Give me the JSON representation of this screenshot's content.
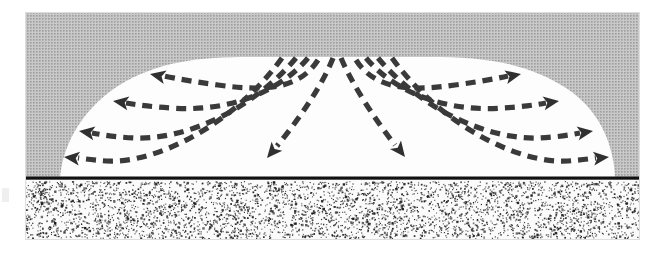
{
  "figure": {
    "type": "cross-section-diagram"
  },
  "colors": {
    "background": "#ffffff",
    "overburden_gray": "#b4b4b4",
    "saturated_zone_white": "#fdfdfd",
    "flow_line": "#3a3a3a",
    "arrowhead": "#303030",
    "water_table_line": "#111111",
    "sand_fill": "#fbfbfb",
    "sand_speckle": "#1c1c1c",
    "frame_edge": "#d8d8d8"
  },
  "layout": {
    "frame": {
      "x": 25,
      "y": 12,
      "width": 615,
      "height": 228
    },
    "gray_block": {
      "x": 25,
      "y": 12,
      "width": 615,
      "height": 166
    },
    "water_table_line": {
      "x1": 25,
      "y1": 178,
      "x2": 640,
      "y2": 178,
      "thickness": 3
    },
    "sand_layer": {
      "x": 25,
      "y": 180,
      "width": 615,
      "height": 60
    },
    "dome": {
      "base_left": 60,
      "base_right": 615,
      "base_y": 178,
      "crest_y": 57,
      "crest_left": 205,
      "crest_right": 470,
      "apex_x": 337
    }
  },
  "labels": {
    "gray_region": "Unsaturated overburden",
    "white_region": "Saturated groundwater mound",
    "sand_region": "Sand aquifer",
    "water_table": "Water table",
    "center_apex": "Recharge apex"
  },
  "chart_data": {
    "type": "line",
    "xlabel": "",
    "ylabel": "",
    "grid": false,
    "legend": "none",
    "annotations": [
      "Flow diverges symmetrically from the central recharge apex",
      "Outer flow lines turn horizontal and exit at the lateral margins",
      "Inner flow lines plunge steeply downward toward the water table"
    ],
    "series": [
      {
        "name": "flow-line-left-1",
        "direction": "left",
        "arrow_at": "start",
        "path": "M 318 60 C 300 88, 268 92, 218 85 C 196 82, 178 79, 164 76",
        "arrow": {
          "x": 150,
          "y": 74,
          "angle": 192
        }
      },
      {
        "name": "flow-line-left-2",
        "direction": "left",
        "arrow_at": "start",
        "path": "M 308 58 C 276 96, 222 112, 172 108 C 152 107, 138 105, 126 103",
        "arrow": {
          "x": 113,
          "y": 101,
          "angle": 189
        }
      },
      {
        "name": "flow-line-left-3",
        "direction": "left",
        "arrow_at": "start",
        "path": "M 296 58 C 254 108, 188 140, 134 138 C 116 137, 103 135, 92 133",
        "arrow": {
          "x": 79,
          "y": 131,
          "angle": 189
        }
      },
      {
        "name": "flow-line-left-4",
        "direction": "left",
        "arrow_at": "start",
        "path": "M 282 58 C 236 122, 158 164, 106 161 C 94 160, 85 159, 78 158",
        "arrow": {
          "x": 64,
          "y": 157,
          "angle": 186
        }
      },
      {
        "name": "flow-line-center-left",
        "direction": "down-left",
        "arrow_at": "end",
        "path": "M 333 58 C 323 84, 300 118, 277 146",
        "arrow": {
          "x": 267,
          "y": 158,
          "angle": 130
        }
      },
      {
        "name": "flow-line-center-right",
        "direction": "down-right",
        "arrow_at": "end",
        "path": "M 341 58 C 352 84, 374 118, 395 145",
        "arrow": {
          "x": 405,
          "y": 157,
          "angle": 52
        }
      },
      {
        "name": "flow-line-right-1",
        "direction": "right",
        "arrow_at": "end",
        "path": "M 356 60 C 374 88, 406 92, 455 85 C 477 82, 495 79, 508 76",
        "arrow": {
          "x": 521,
          "y": 74,
          "angle": 348
        }
      },
      {
        "name": "flow-line-right-2",
        "direction": "right",
        "arrow_at": "end",
        "path": "M 366 58 C 398 96, 452 112, 502 108 C 521 107, 535 105, 546 103",
        "arrow": {
          "x": 559,
          "y": 101,
          "angle": 351
        }
      },
      {
        "name": "flow-line-right-3",
        "direction": "right",
        "arrow_at": "end",
        "path": "M 378 58 C 420 108, 486 140, 540 138 C 557 137, 570 135, 580 133",
        "arrow": {
          "x": 593,
          "y": 131,
          "angle": 351
        }
      },
      {
        "name": "flow-line-right-4",
        "direction": "right",
        "arrow_at": "end",
        "path": "M 392 58 C 438 122, 516 164, 568 161 C 580 160, 589 159, 596 158",
        "arrow": {
          "x": 609,
          "y": 157,
          "angle": 354
        }
      }
    ]
  }
}
